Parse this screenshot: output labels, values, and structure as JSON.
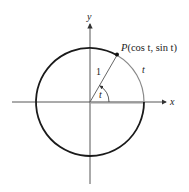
{
  "diagram": {
    "axes": {
      "x_label": "x",
      "y_label": "y"
    },
    "point": {
      "label_prefix": "P",
      "label_coords": "(cos t, sin t)"
    },
    "radius_label": "1",
    "angle_label": "t",
    "arc_label": "t",
    "colors": {
      "circle": "#1a1a1a",
      "arc_highlight": "#8a8a8a",
      "axis": "#333333",
      "segment_highlight": "#9a9a9a"
    }
  }
}
